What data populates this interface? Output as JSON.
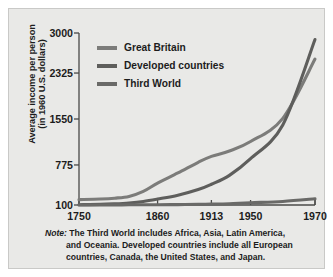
{
  "figure": {
    "background_color": "#e9e9e7",
    "axis_color": "#4a4a48"
  },
  "axes": {
    "ylabel_line1": "Average income per person",
    "ylabel_line2": "(in 1960 U.S. dollars)",
    "yticks": [
      "100",
      "775",
      "1550",
      "2325",
      "3000"
    ],
    "xticks": [
      "1750",
      "1860",
      "1913",
      "1950",
      "1970"
    ]
  },
  "legend": {
    "entries": [
      {
        "label": "Great Britain",
        "color": "#7c7c7a"
      },
      {
        "label": "Developed countries",
        "color": "#5e5e5c"
      },
      {
        "label": "Third World",
        "color": "#6a6a68"
      }
    ]
  },
  "note": {
    "word": "Note:",
    "line1": "The Third World includes Africa, Asia, Latin America,",
    "line2": "and Oceania. Developed countries include all European",
    "line3": "countries, Canada, the United States, and Japan."
  },
  "chart_data": {
    "type": "line",
    "title": "",
    "xlabel": "",
    "ylabel": "Average income per person (in 1960 U.S. dollars)",
    "xlim": [
      1750,
      1970
    ],
    "ylim": [
      100,
      3000
    ],
    "xticks": [
      1750,
      1860,
      1913,
      1950,
      1970
    ],
    "yticks": [
      100,
      775,
      1550,
      2325,
      3000
    ],
    "grid": false,
    "legend_position": "upper-left-inside",
    "x": [
      1750,
      1780,
      1800,
      1820,
      1840,
      1860,
      1880,
      1900,
      1913,
      1930,
      1950,
      1960,
      1970
    ],
    "series": [
      {
        "name": "Great Britain",
        "color": "#7c7c7a",
        "values": [
          190,
          200,
          215,
          245,
          330,
          470,
          640,
          820,
          920,
          1010,
          1170,
          1560,
          2560
        ]
      },
      {
        "name": "Developed countries",
        "color": "#5e5e5c",
        "values": [
          105,
          110,
          120,
          135,
          160,
          200,
          265,
          360,
          450,
          600,
          880,
          1450,
          2890
        ]
      },
      {
        "name": "Third World",
        "color": "#6a6a68",
        "values": [
          100,
          101,
          102,
          103,
          104,
          105,
          107,
          110,
          114,
          122,
          138,
          160,
          205
        ]
      }
    ],
    "annotations": [
      "Note: The Third World includes Africa, Asia, Latin America, and Oceania. Developed countries include all European countries, Canada, the United States, and Japan."
    ]
  }
}
